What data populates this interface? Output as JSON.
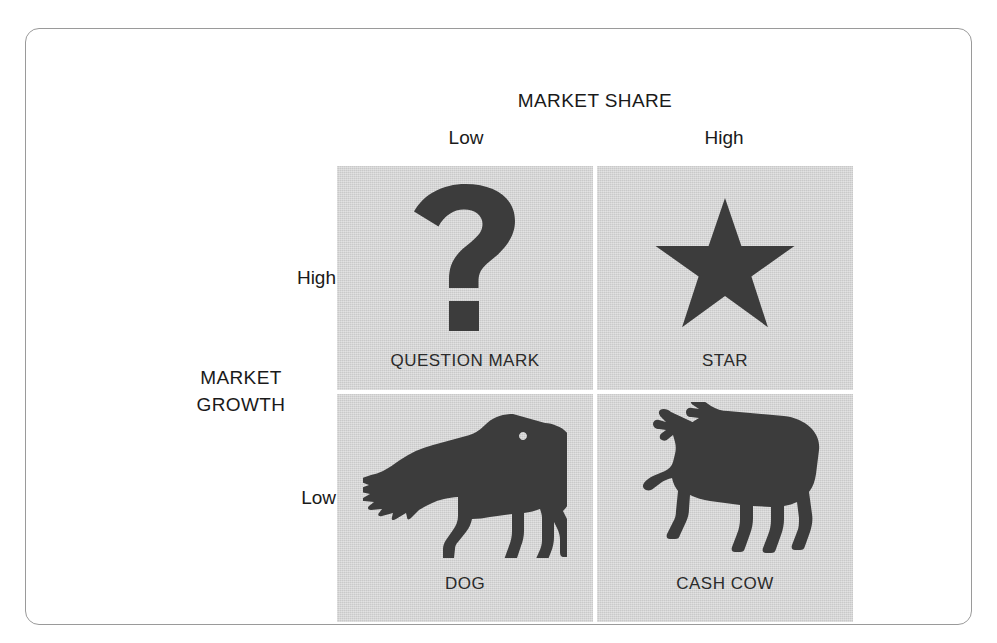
{
  "diagram": {
    "type": "bcg-growth-share-matrix",
    "x_axis": {
      "title": "MARKET SHARE",
      "categories": [
        "Low",
        "High"
      ]
    },
    "y_axis": {
      "title_line1": "MARKET",
      "title_line2": "GROWTH",
      "categories": [
        "High",
        "Low"
      ]
    },
    "colors": {
      "panel": "#c9c9c9",
      "silhouette": "#3c3c3c",
      "text": "#1a1a1a",
      "frame": "#9a9a9a",
      "divider": "#ffffff"
    },
    "quadrants": [
      {
        "id": "question-mark",
        "label": "QUESTION MARK",
        "icon": "question-mark-icon",
        "market_share": "Low",
        "market_growth": "High"
      },
      {
        "id": "star",
        "label": "STAR",
        "icon": "star-icon",
        "market_share": "High",
        "market_growth": "High"
      },
      {
        "id": "dog",
        "label": "DOG",
        "icon": "dog-silhouette-icon",
        "market_share": "Low",
        "market_growth": "Low"
      },
      {
        "id": "cash-cow",
        "label": "CASH COW",
        "icon": "cow-silhouette-icon",
        "market_share": "High",
        "market_growth": "Low"
      }
    ]
  }
}
